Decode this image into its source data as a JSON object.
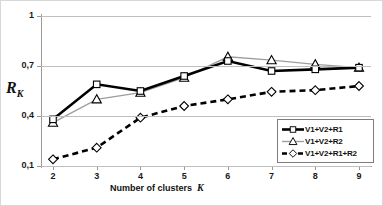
{
  "chart_data": {
    "type": "line",
    "title": "",
    "xlabel": "Number of clusters  K",
    "xlabel_text": "Number of clusters",
    "xlabel_var": "K",
    "ylabel": "R_K",
    "ylabel_main": "R",
    "ylabel_sub": "K",
    "categories": [
      2,
      3,
      4,
      5,
      6,
      7,
      8,
      9
    ],
    "x_tick_labels": [
      "2",
      "3",
      "4",
      "5",
      "6",
      "7",
      "8",
      "9"
    ],
    "y_tick_labels": [
      "0,1",
      "0,4",
      "0,7",
      "1"
    ],
    "y_tick_values": [
      0.1,
      0.4,
      0.7,
      1.0
    ],
    "xlim": [
      2,
      9
    ],
    "ylim": [
      0.1,
      1.0
    ],
    "grid": "horizontal",
    "legend_position": "bottom-right",
    "series": [
      {
        "name": "V1+V2+R1",
        "marker": "square",
        "line_style": "solid",
        "line_color": "#000000",
        "line_width": 2.6,
        "values": [
          0.38,
          0.59,
          0.55,
          0.64,
          0.73,
          0.67,
          0.68,
          0.69
        ]
      },
      {
        "name": "V1+V2+R2",
        "marker": "triangle",
        "line_style": "solid",
        "line_color": "#9e9e9e",
        "line_width": 1.4,
        "values": [
          0.36,
          0.5,
          0.54,
          0.63,
          0.755,
          0.735,
          0.71,
          0.69
        ]
      },
      {
        "name": "V1+V2+R1+R2",
        "marker": "diamond",
        "line_style": "dashed",
        "line_color": "#000000",
        "line_width": 2.6,
        "values": [
          0.14,
          0.21,
          0.39,
          0.46,
          0.5,
          0.545,
          0.555,
          0.58
        ]
      }
    ]
  },
  "legend": {
    "items": [
      {
        "label": "V1+V2+R1",
        "marker": "square"
      },
      {
        "label": "V1+V2+R2",
        "marker": "triangle"
      },
      {
        "label": "V1+V2+R1+R2",
        "marker": "diamond"
      }
    ]
  }
}
